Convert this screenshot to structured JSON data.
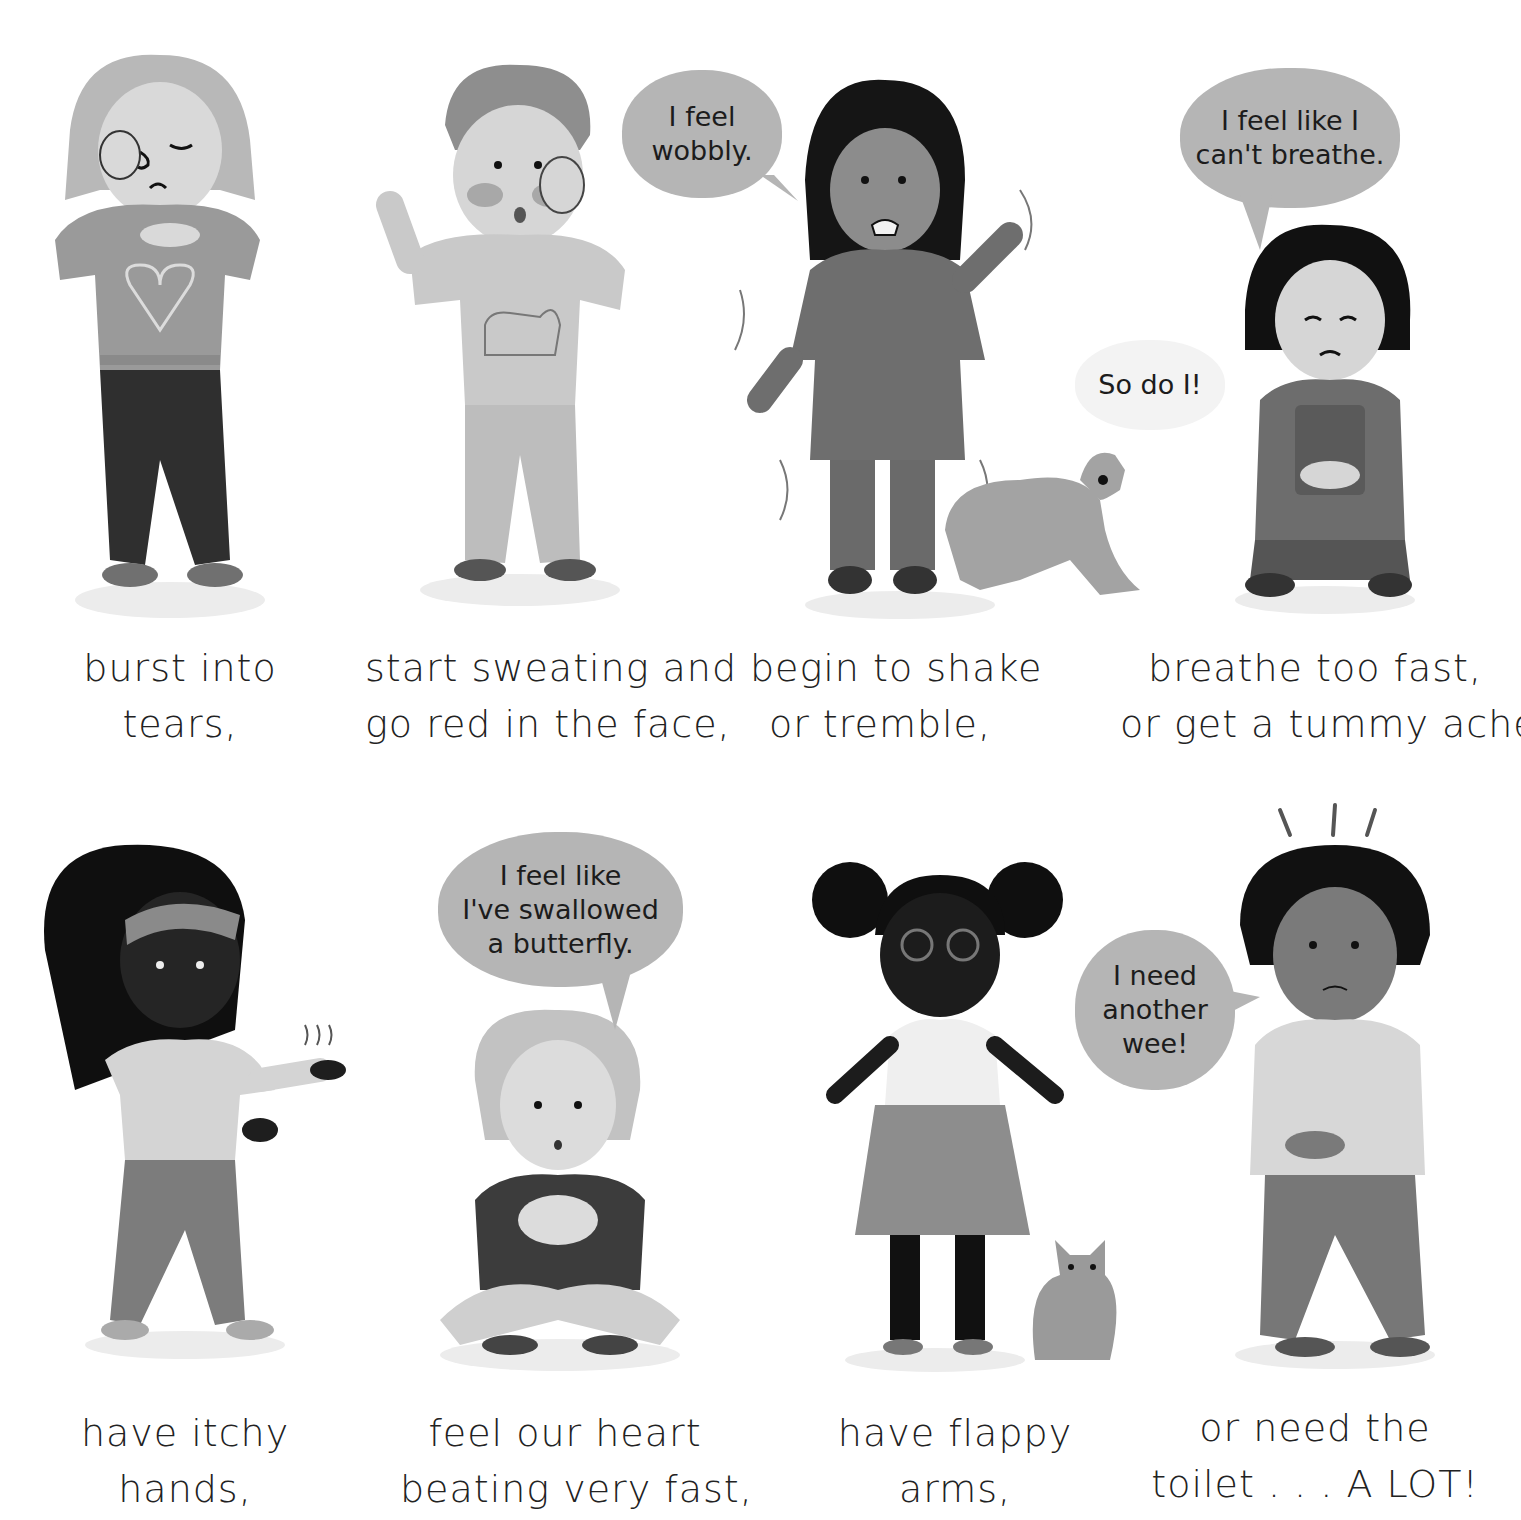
{
  "page": {
    "background": "#ffffff",
    "style": "grayscale children's book illustration"
  },
  "rows": [
    {
      "panels": [
        {
          "id": "crying",
          "figure": "child rubbing eye with tears",
          "caption": [
            "burst into",
            "tears,"
          ]
        },
        {
          "id": "sweating",
          "figure": "child with red cheeks and sweat drops, dog on sweater",
          "caption": [
            "start sweating and",
            "go red in the face,"
          ]
        },
        {
          "id": "shaking",
          "figure": "girl shaking with trembling dog",
          "speech": [
            "I feel",
            "wobbly."
          ],
          "dog_speech": [
            "So do I!"
          ],
          "caption": [
            "begin to shake",
            "or tremble,"
          ]
        },
        {
          "id": "breathing",
          "figure": "kneeling girl holding tummy",
          "speech": [
            "I feel like I",
            "can't breathe."
          ],
          "caption": [
            "breathe too fast,",
            "or get a tummy ache,"
          ]
        }
      ]
    },
    {
      "panels": [
        {
          "id": "itchy",
          "figure": "girl with headband shaking itchy hands",
          "caption": [
            "have itchy",
            "hands,"
          ]
        },
        {
          "id": "heart",
          "figure": "seated child with hands on chest",
          "speech": [
            "I feel like",
            "I've swallowed",
            "a butterfly."
          ],
          "caption": [
            "feel our heart",
            "beating very fast,"
          ]
        },
        {
          "id": "flappy",
          "figure": "girl with glasses flapping arms, cat",
          "caption": [
            "have flappy",
            "arms,"
          ]
        },
        {
          "id": "toilet",
          "figure": "boy crossing legs needing toilet",
          "speech": [
            "I need",
            "another",
            "wee!"
          ],
          "caption": [
            "or need the",
            "toilet . . . A  LOT!"
          ]
        }
      ]
    }
  ],
  "colors": {
    "bubble": "#b5b5b5",
    "bubble_light": "#f3f3f3",
    "text": "#222222",
    "skin_light": "#d9d9d9",
    "skin_mid": "#8a8a8a",
    "skin_dark": "#2a2a2a",
    "cloth_mid": "#9a9a9a",
    "cloth_dark": "#3a3a3a",
    "hair_dark": "#111111",
    "hair_light": "#b8b8b8",
    "shadow": "#ececec"
  }
}
